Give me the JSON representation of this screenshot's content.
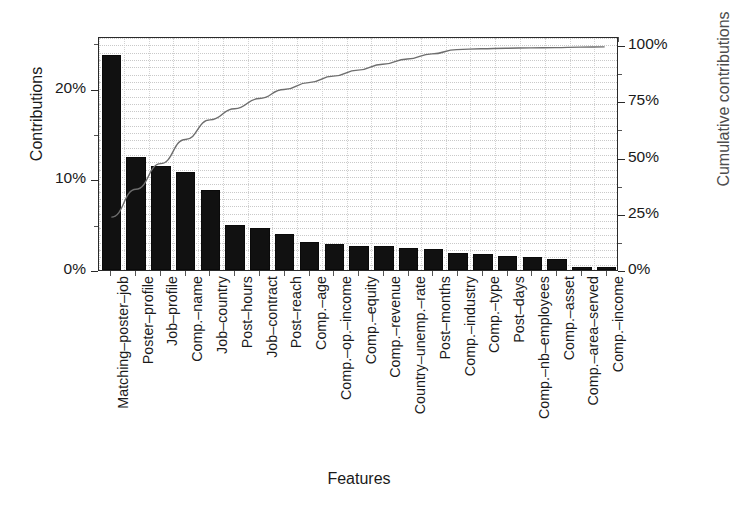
{
  "chart_data": {
    "type": "bar",
    "title": "",
    "xlabel": "Features",
    "ylabel": "Contributions",
    "y2label": "Cumulative contributions",
    "grid": true,
    "legend": "none",
    "ylim": [
      0,
      25.8
    ],
    "y2lim": [
      0,
      104
    ],
    "yticks": [
      "0%",
      "10%",
      "20%"
    ],
    "ytick_values": [
      0,
      10,
      20
    ],
    "y2ticks": [
      "0%",
      "25%",
      "50%",
      "75%",
      "100%"
    ],
    "y2tick_values": [
      0,
      25,
      50,
      75,
      100
    ],
    "categories": [
      "Matching–poster–job",
      "Poster–profile",
      "Job–profile",
      "Comp.–name",
      "Job–country",
      "Post–hours",
      "Job–contract",
      "Post–reach",
      "Comp.–age",
      "Comp.–op.–income",
      "Comp.–equity",
      "Comp.–revenue",
      "Country–unemp.–rate",
      "Post–months",
      "Comp.–industry",
      "Comp.–type",
      "Post–days",
      "Comp.–nb–employees",
      "Comp.–asset",
      "Comp.–area–served",
      "Comp.–income"
    ],
    "values": [
      23.7,
      12.5,
      11.5,
      10.8,
      8.8,
      5.0,
      4.6,
      4.0,
      3.1,
      2.9,
      2.7,
      2.6,
      2.4,
      2.3,
      1.9,
      1.8,
      1.6,
      1.4,
      1.2,
      0.35,
      0.3
    ],
    "series": [
      {
        "name": "Contributions",
        "type": "bar",
        "axis": "left",
        "color": "#111111",
        "values": [
          23.7,
          12.5,
          11.5,
          10.8,
          8.8,
          5.0,
          4.6,
          4.0,
          3.1,
          2.9,
          2.7,
          2.6,
          2.4,
          2.3,
          1.9,
          1.8,
          1.6,
          1.4,
          1.2,
          0.35,
          0.3
        ]
      },
      {
        "name": "Cumulative contributions",
        "type": "line",
        "axis": "right",
        "color": "#6e6e6e",
        "values": [
          23.7,
          36.2,
          47.7,
          58.5,
          67.3,
          72.3,
          76.9,
          80.9,
          84.0,
          86.9,
          89.6,
          92.2,
          94.6,
          96.9,
          98.8,
          99.2,
          99.4,
          99.55,
          99.7,
          99.9,
          100.0
        ]
      }
    ]
  },
  "axes": {
    "left_title": "Contributions",
    "right_title": "Cumulative contributions",
    "bottom_title": "Features"
  }
}
